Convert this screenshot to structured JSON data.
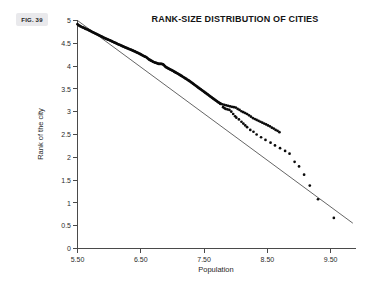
{
  "figure": {
    "badge_label": "FIG. 39"
  },
  "chart_data": {
    "type": "scatter",
    "title": "RANK-SIZE DISTRIBUTION OF CITIES",
    "xlabel": "Population",
    "ylabel": "Rank of the city",
    "xlim": [
      5.5,
      9.9
    ],
    "ylim": [
      0,
      5
    ],
    "grid": false,
    "legend": "none",
    "x_ticks": [
      5.5,
      6.5,
      7.5,
      8.5,
      9.5
    ],
    "x_tick_labels": [
      "5.50",
      "6.50",
      "7.50",
      "8.50",
      "9.50"
    ],
    "y_ticks": [
      0,
      0.5,
      1,
      1.5,
      2,
      2.5,
      3,
      3.5,
      4,
      4.5,
      5
    ],
    "y_tick_labels": [
      "0",
      "0.5",
      "1",
      "1.5",
      "2",
      "2.5",
      "3",
      "3.5",
      "4",
      "4.5",
      "5"
    ],
    "point_color": "#0a0a0a",
    "line_color": "#3d3d3d",
    "fit_line": {
      "name": "Zipf regression line",
      "x": [
        5.5,
        9.85
      ],
      "y": [
        5.0,
        0.555
      ],
      "slope": -1.0218,
      "intercept": 10.62
    },
    "series": [
      {
        "name": "Cities",
        "points": [
          [
            5.5,
            4.92
          ],
          [
            5.513,
            4.9
          ],
          [
            5.527,
            4.888
          ],
          [
            5.54,
            4.878
          ],
          [
            5.553,
            4.868
          ],
          [
            5.567,
            4.858
          ],
          [
            5.58,
            4.85
          ],
          [
            5.594,
            4.842
          ],
          [
            5.607,
            4.833
          ],
          [
            5.62,
            4.824
          ],
          [
            5.634,
            4.816
          ],
          [
            5.647,
            4.808
          ],
          [
            5.661,
            4.8
          ],
          [
            5.674,
            4.79
          ],
          [
            5.688,
            4.781
          ],
          [
            5.701,
            4.772
          ],
          [
            5.715,
            4.762
          ],
          [
            5.728,
            4.752
          ],
          [
            5.742,
            4.742
          ],
          [
            5.755,
            4.733
          ],
          [
            5.769,
            4.724
          ],
          [
            5.782,
            4.715
          ],
          [
            5.796,
            4.706
          ],
          [
            5.809,
            4.697
          ],
          [
            5.823,
            4.688
          ],
          [
            5.836,
            4.679
          ],
          [
            5.85,
            4.67
          ],
          [
            5.864,
            4.66
          ],
          [
            5.877,
            4.65
          ],
          [
            5.891,
            4.64
          ],
          [
            5.904,
            4.63
          ],
          [
            5.918,
            4.62
          ],
          [
            5.931,
            4.612
          ],
          [
            5.945,
            4.604
          ],
          [
            5.958,
            4.596
          ],
          [
            5.972,
            4.588
          ],
          [
            5.985,
            4.58
          ],
          [
            5.999,
            4.572
          ],
          [
            6.012,
            4.565
          ],
          [
            6.026,
            4.556
          ],
          [
            6.04,
            4.546
          ],
          [
            6.053,
            4.536
          ],
          [
            6.067,
            4.528
          ],
          [
            6.08,
            4.52
          ],
          [
            6.094,
            4.512
          ],
          [
            6.107,
            4.503
          ],
          [
            6.121,
            4.494
          ],
          [
            6.134,
            4.485
          ],
          [
            6.148,
            4.476
          ],
          [
            6.161,
            4.468
          ],
          [
            6.175,
            4.46
          ],
          [
            6.189,
            4.452
          ],
          [
            6.202,
            4.443
          ],
          [
            6.216,
            4.434
          ],
          [
            6.229,
            4.426
          ],
          [
            6.243,
            4.418
          ],
          [
            6.256,
            4.41
          ],
          [
            6.27,
            4.402
          ],
          [
            6.283,
            4.394
          ],
          [
            6.297,
            4.386
          ],
          [
            6.31,
            4.378
          ],
          [
            6.324,
            4.37
          ],
          [
            6.338,
            4.362
          ],
          [
            6.351,
            4.354
          ],
          [
            6.365,
            4.346
          ],
          [
            6.378,
            4.338
          ],
          [
            6.392,
            4.33
          ],
          [
            6.405,
            4.321
          ],
          [
            6.419,
            4.312
          ],
          [
            6.432,
            4.303
          ],
          [
            6.446,
            4.294
          ],
          [
            6.459,
            4.285
          ],
          [
            6.473,
            4.276
          ],
          [
            6.487,
            4.266
          ],
          [
            6.5,
            4.256
          ],
          [
            6.514,
            4.246
          ],
          [
            6.527,
            4.236
          ],
          [
            6.541,
            4.226
          ],
          [
            6.554,
            4.216
          ],
          [
            6.568,
            4.206
          ],
          [
            6.581,
            4.2
          ],
          [
            6.595,
            4.186
          ],
          [
            6.608,
            4.17
          ],
          [
            6.622,
            4.155
          ],
          [
            6.636,
            4.14
          ],
          [
            6.649,
            4.13
          ],
          [
            6.663,
            4.12
          ],
          [
            6.676,
            4.112
          ],
          [
            6.69,
            4.096
          ],
          [
            6.703,
            4.09
          ],
          [
            6.717,
            4.082
          ],
          [
            6.73,
            4.074
          ],
          [
            6.744,
            4.07
          ],
          [
            6.757,
            4.062
          ],
          [
            6.771,
            4.056
          ],
          [
            6.785,
            4.048
          ],
          [
            6.798,
            4.05
          ],
          [
            6.812,
            4.05
          ],
          [
            6.825,
            4.048
          ],
          [
            6.839,
            4.044
          ],
          [
            6.852,
            4.04
          ],
          [
            6.866,
            4.02
          ],
          [
            6.879,
            4.0
          ],
          [
            6.893,
            3.982
          ],
          [
            6.906,
            3.97
          ],
          [
            6.92,
            3.96
          ],
          [
            6.934,
            3.95
          ],
          [
            6.947,
            3.94
          ],
          [
            6.961,
            3.93
          ],
          [
            6.974,
            3.92
          ],
          [
            6.988,
            3.91
          ],
          [
            7.001,
            3.9
          ],
          [
            7.015,
            3.89
          ],
          [
            7.028,
            3.878
          ],
          [
            7.042,
            3.866
          ],
          [
            7.055,
            3.856
          ],
          [
            7.069,
            3.846
          ],
          [
            7.083,
            3.836
          ],
          [
            7.096,
            3.826
          ],
          [
            7.11,
            3.814
          ],
          [
            7.123,
            3.802
          ],
          [
            7.137,
            3.79
          ],
          [
            7.15,
            3.778
          ],
          [
            7.164,
            3.766
          ],
          [
            7.177,
            3.754
          ],
          [
            7.191,
            3.742
          ],
          [
            7.204,
            3.73
          ],
          [
            7.218,
            3.718
          ],
          [
            7.232,
            3.706
          ],
          [
            7.245,
            3.694
          ],
          [
            7.259,
            3.682
          ],
          [
            7.272,
            3.67
          ],
          [
            7.286,
            3.656
          ],
          [
            7.299,
            3.642
          ],
          [
            7.313,
            3.628
          ],
          [
            7.326,
            3.614
          ],
          [
            7.34,
            3.6
          ],
          [
            7.353,
            3.586
          ],
          [
            7.367,
            3.572
          ],
          [
            7.381,
            3.558
          ],
          [
            7.394,
            3.544
          ],
          [
            7.408,
            3.53
          ],
          [
            7.421,
            3.516
          ],
          [
            7.435,
            3.502
          ],
          [
            7.448,
            3.49
          ],
          [
            7.462,
            3.476
          ],
          [
            7.475,
            3.462
          ],
          [
            7.489,
            3.448
          ],
          [
            7.502,
            3.434
          ],
          [
            7.516,
            3.42
          ],
          [
            7.53,
            3.406
          ],
          [
            7.543,
            3.392
          ],
          [
            7.557,
            3.378
          ],
          [
            7.57,
            3.364
          ],
          [
            7.584,
            3.35
          ],
          [
            7.597,
            3.336
          ],
          [
            7.611,
            3.322
          ],
          [
            7.624,
            3.308
          ],
          [
            7.638,
            3.294
          ],
          [
            7.651,
            3.28
          ],
          [
            7.665,
            3.266
          ],
          [
            7.679,
            3.252
          ],
          [
            7.692,
            3.24
          ],
          [
            7.706,
            3.226
          ],
          [
            7.719,
            3.212
          ],
          [
            7.733,
            3.2
          ],
          [
            7.746,
            3.19
          ],
          [
            7.76,
            3.175
          ],
          [
            7.79,
            3.162
          ],
          [
            7.82,
            3.15
          ],
          [
            7.85,
            3.14
          ],
          [
            7.88,
            3.128
          ],
          [
            7.91,
            3.118
          ],
          [
            7.94,
            3.108
          ],
          [
            7.97,
            3.1
          ],
          [
            8.0,
            3.09
          ],
          [
            8.03,
            3.06
          ],
          [
            8.06,
            3.04
          ],
          [
            8.09,
            3.01
          ],
          [
            8.12,
            2.99
          ],
          [
            8.15,
            2.97
          ],
          [
            8.18,
            2.95
          ],
          [
            8.21,
            2.92
          ],
          [
            8.24,
            2.89
          ],
          [
            8.27,
            2.86
          ],
          [
            8.3,
            2.84
          ],
          [
            8.33,
            2.82
          ],
          [
            8.36,
            2.8
          ],
          [
            8.39,
            2.78
          ],
          [
            8.42,
            2.76
          ],
          [
            8.45,
            2.74
          ],
          [
            8.48,
            2.72
          ],
          [
            8.51,
            2.7
          ],
          [
            8.54,
            2.68
          ],
          [
            8.57,
            2.65
          ],
          [
            8.6,
            2.63
          ],
          [
            8.63,
            2.6
          ],
          [
            8.66,
            2.58
          ],
          [
            8.69,
            2.55
          ],
          [
            7.76,
            3.17
          ],
          [
            7.8,
            3.1
          ],
          [
            7.82,
            3.08
          ],
          [
            7.84,
            3.06
          ],
          [
            7.87,
            3.05
          ],
          [
            7.9,
            3.04
          ],
          [
            7.93,
            3.0
          ],
          [
            7.96,
            2.95
          ],
          [
            7.99,
            2.9
          ],
          [
            8.01,
            2.87
          ],
          [
            8.05,
            2.83
          ],
          [
            8.09,
            2.78
          ],
          [
            8.12,
            2.74
          ],
          [
            8.15,
            2.7
          ],
          [
            8.18,
            2.66
          ],
          [
            8.23,
            2.6
          ],
          [
            8.28,
            2.56
          ],
          [
            8.33,
            2.5
          ],
          [
            8.4,
            2.44
          ],
          [
            8.47,
            2.38
          ],
          [
            8.55,
            2.32
          ],
          [
            8.62,
            2.26
          ],
          [
            8.7,
            2.2
          ],
          [
            8.78,
            2.14
          ],
          [
            8.85,
            2.08
          ],
          [
            8.93,
            1.9
          ],
          [
            9.0,
            1.8
          ],
          [
            9.08,
            1.62
          ],
          [
            9.17,
            1.38
          ],
          [
            9.3,
            1.08
          ],
          [
            9.55,
            0.67
          ]
        ]
      }
    ]
  }
}
